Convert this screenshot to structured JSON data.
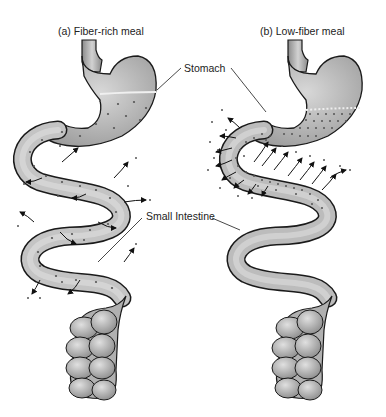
{
  "panels": [
    {
      "id": "a",
      "title": "(a) Fiber-rich meal"
    },
    {
      "id": "b",
      "title": "(b) Low-fiber meal"
    }
  ],
  "labels": {
    "stomach": "Stomach",
    "small_intestine": "Small Intestine"
  },
  "colors": {
    "organ_fill": "#b8b8b8",
    "organ_dark": "#8a8a8a",
    "organ_light": "#dcdcdc",
    "outline": "#1a1a1a",
    "dots": "#555555"
  }
}
